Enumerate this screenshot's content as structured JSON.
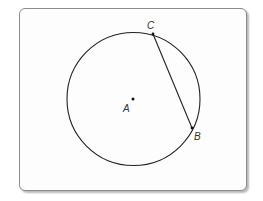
{
  "diagram": {
    "type": "circle-with-chord",
    "center": {
      "label": "A",
      "x": 133,
      "y": 99
    },
    "radius": 67,
    "points": [
      {
        "label": "C",
        "x": 153,
        "y": 34,
        "label_x": 148,
        "label_y": 29
      },
      {
        "label": "B",
        "x": 192,
        "y": 128,
        "label_x": 194,
        "label_y": 140
      }
    ],
    "chord": {
      "from": "C",
      "to": "B"
    },
    "center_label_pos": {
      "x": 124,
      "y": 111
    },
    "colors": {
      "stroke": "#222222",
      "frame_border": "#8c8c8c",
      "background": "#ffffff"
    }
  }
}
